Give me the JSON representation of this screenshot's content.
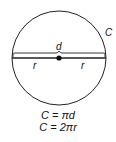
{
  "diagram": {
    "labels": {
      "circumference": "C",
      "diameter": "d",
      "radius_left": "r",
      "radius_right": "r"
    },
    "formulas": [
      "C = πd",
      "C = 2πr"
    ],
    "colors": {
      "stroke": "#222222",
      "background": "#ffffff"
    }
  }
}
